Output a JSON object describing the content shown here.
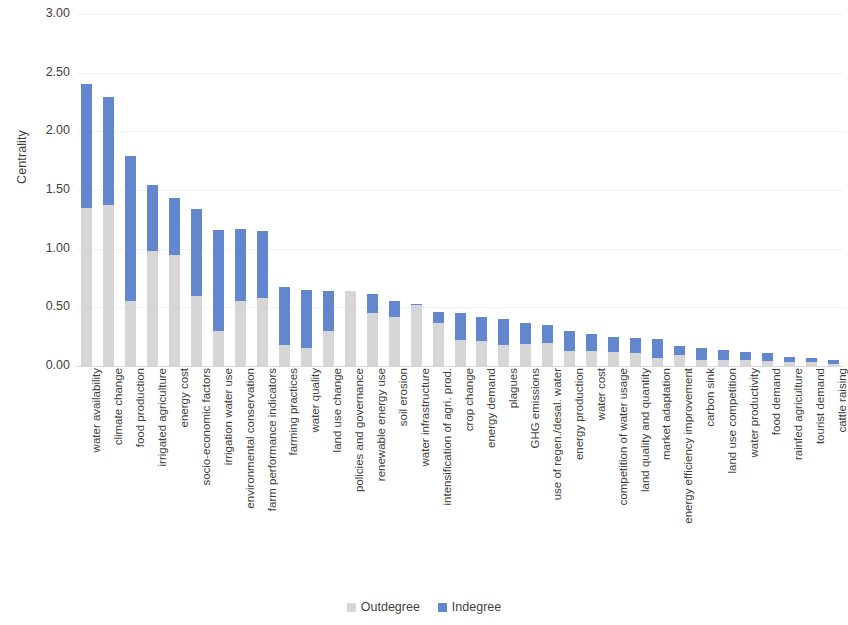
{
  "chart_data": {
    "type": "bar",
    "subtype": "stacked-column",
    "title": "",
    "xlabel": "",
    "ylabel": "Centrality",
    "ylim": [
      0,
      3.0
    ],
    "ytick_step": 0.5,
    "ytick_labels": [
      "3.00",
      "2.50",
      "2.00",
      "1.50",
      "1.00",
      "0.50",
      "0.00"
    ],
    "ytick_values": [
      3.0,
      2.5,
      2.0,
      1.5,
      1.0,
      0.5,
      0.0
    ],
    "grid": true,
    "grid_axis": "y",
    "legend_position": "bottom",
    "colors": {
      "outdegree": "#d6d6d6",
      "indegree": "#6287ce"
    },
    "categories": [
      "water availability",
      "climate change",
      "food production",
      "irrigated agriculture",
      "energy cost",
      "socio-economic factors",
      "irrigation water use",
      "environmental conservation",
      "farm performance indicators",
      "farming practices",
      "water quality",
      "land use change",
      "policies and governance",
      "renewable energy use",
      "soil erosion",
      "water infrastructure",
      "intensification of agri. prod.",
      "crop change",
      "energy demand",
      "plagues",
      "GHG emissions",
      "use of regen./desal. water",
      "energy production",
      "water cost",
      "competition of water usage",
      "land quality and quantity",
      "market adaptation",
      "energy efficiency improvement",
      "carbon sink",
      "land use competition",
      "water productivity",
      "food demand",
      "rainfed agriculture",
      "tourist demand",
      "cattle raising"
    ],
    "series": [
      {
        "name": "Outdegree",
        "color": "#d6d6d6",
        "values": [
          1.35,
          1.37,
          0.55,
          0.98,
          0.95,
          0.6,
          0.3,
          0.55,
          0.58,
          0.18,
          0.15,
          0.3,
          0.64,
          0.45,
          0.42,
          0.52,
          0.37,
          0.22,
          0.21,
          0.18,
          0.19,
          0.2,
          0.13,
          0.13,
          0.12,
          0.11,
          0.07,
          0.09,
          0.05,
          0.05,
          0.05,
          0.04,
          0.03,
          0.03,
          0.02
        ]
      },
      {
        "name": "Indegree",
        "color": "#6287ce",
        "values": [
          1.05,
          0.92,
          1.24,
          0.56,
          0.48,
          0.74,
          0.86,
          0.62,
          0.57,
          0.49,
          0.5,
          0.34,
          0.0,
          0.16,
          0.13,
          0.01,
          0.09,
          0.23,
          0.21,
          0.22,
          0.18,
          0.15,
          0.17,
          0.14,
          0.13,
          0.13,
          0.16,
          0.08,
          0.1,
          0.09,
          0.07,
          0.07,
          0.05,
          0.04,
          0.03
        ]
      }
    ],
    "totals": [
      2.4,
      2.29,
      1.79,
      1.54,
      1.43,
      1.34,
      1.16,
      1.17,
      1.15,
      0.67,
      0.65,
      0.64,
      0.64,
      0.61,
      0.55,
      0.53,
      0.46,
      0.45,
      0.42,
      0.4,
      0.37,
      0.35,
      0.3,
      0.27,
      0.25,
      0.24,
      0.23,
      0.17,
      0.15,
      0.14,
      0.12,
      0.11,
      0.08,
      0.07,
      0.05
    ]
  },
  "legend": {
    "items": [
      {
        "label": "Outdegree",
        "color": "#d6d6d6"
      },
      {
        "label": "Indegree",
        "color": "#6287ce"
      }
    ]
  }
}
